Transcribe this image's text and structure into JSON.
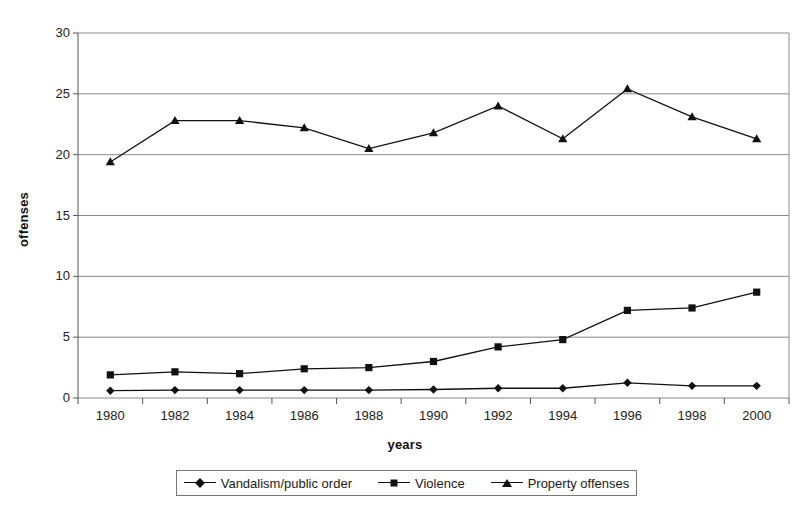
{
  "chart_data": {
    "type": "line",
    "title": "",
    "xlabel": "years",
    "ylabel": "offenses",
    "categories": [
      1980,
      1982,
      1984,
      1986,
      1988,
      1990,
      1992,
      1994,
      1996,
      1998,
      2000
    ],
    "x_tick_labels": [
      "1980",
      "1982",
      "1984",
      "1986",
      "1988",
      "1990",
      "1992",
      "1994",
      "1996",
      "1998",
      "2000"
    ],
    "y_tick_labels": [
      "0",
      "5",
      "10",
      "15",
      "20",
      "25",
      "30"
    ],
    "y_ticks": [
      0,
      5,
      10,
      15,
      20,
      25,
      30
    ],
    "ylim": [
      0,
      30
    ],
    "grid": "horizontal",
    "legend_position": "bottom",
    "series": [
      {
        "name": "Vandalism/public order",
        "marker": "diamond",
        "color": "#111111",
        "values": [
          0.6,
          0.65,
          0.65,
          0.65,
          0.65,
          0.7,
          0.8,
          0.8,
          1.25,
          1.0,
          1.0
        ]
      },
      {
        "name": "Violence",
        "marker": "square",
        "color": "#111111",
        "values": [
          1.9,
          2.15,
          2.0,
          2.4,
          2.5,
          3.0,
          4.2,
          4.8,
          7.2,
          7.4,
          8.7
        ]
      },
      {
        "name": "Property offenses",
        "marker": "triangle",
        "color": "#111111",
        "values": [
          19.4,
          22.8,
          22.8,
          22.2,
          20.5,
          21.8,
          24.0,
          21.3,
          25.4,
          23.1,
          21.3
        ]
      }
    ]
  },
  "legend": {
    "items": [
      {
        "label": "Vandalism/public order",
        "marker": "diamond"
      },
      {
        "label": "Violence",
        "marker": "square"
      },
      {
        "label": "Property offenses",
        "marker": "triangle"
      }
    ]
  }
}
